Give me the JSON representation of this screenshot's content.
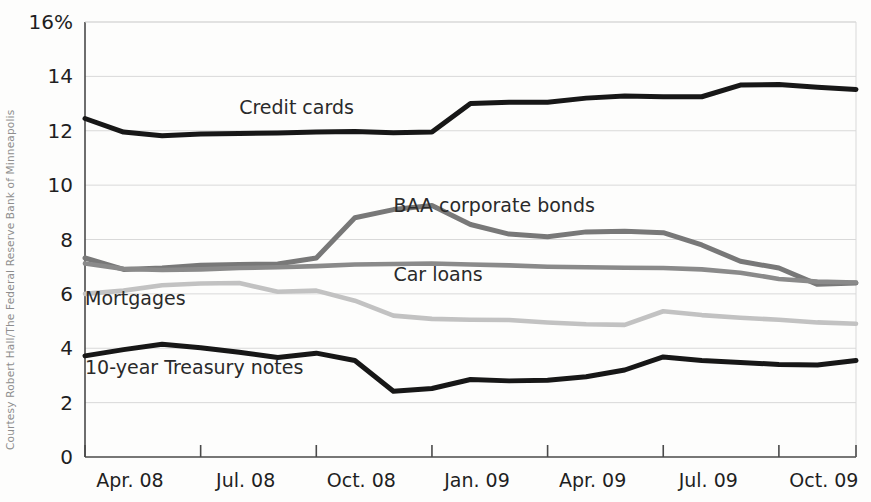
{
  "credit": {
    "text": "Courtesy Robert Hall/The Federal Reserve Bank of Minneapolis"
  },
  "chart_data": {
    "type": "line",
    "title": "",
    "subtitle": "",
    "xlabel": "",
    "ylabel": "",
    "grid": true,
    "legend_position": "inline-labels",
    "ylim": [
      0,
      16
    ],
    "yticks": [
      0,
      2,
      4,
      6,
      8,
      10,
      12,
      14,
      16
    ],
    "ytick_labels": [
      "0",
      "2",
      "4",
      "6",
      "8",
      "10",
      "12",
      "14",
      "16%"
    ],
    "xlim": [
      "2008-04",
      "2009-12"
    ],
    "xticks": [
      "2008-04",
      "2008-07",
      "2008-10",
      "2009-01",
      "2009-04",
      "2009-07",
      "2009-10"
    ],
    "xtick_labels": [
      "Apr. 08",
      "Jul. 08",
      "Oct. 08",
      "Jan. 09",
      "Apr. 09",
      "Jul. 09",
      "Oct. 09"
    ],
    "x": [
      "2008-04",
      "2008-05",
      "2008-06",
      "2008-07",
      "2008-08",
      "2008-09",
      "2008-10",
      "2008-11",
      "2008-12",
      "2009-01",
      "2009-02",
      "2009-03",
      "2009-04",
      "2009-05",
      "2009-06",
      "2009-07",
      "2009-08",
      "2009-09",
      "2009-10",
      "2009-11",
      "2009-12"
    ],
    "series": [
      {
        "name": "Credit cards",
        "color": "#171717",
        "width": 5.0,
        "label_x": "2008-08",
        "label_y": 12.62,
        "values": [
          12.45,
          11.95,
          11.82,
          11.88,
          11.9,
          11.92,
          11.95,
          11.97,
          11.93,
          11.95,
          13.0,
          13.05,
          13.05,
          13.2,
          13.28,
          13.25,
          13.25,
          13.68,
          13.7,
          13.6,
          13.52
        ]
      },
      {
        "name": "BAA corporate bonds",
        "color": "#787878",
        "width": 5.0,
        "label_x": "2008-12",
        "label_y": 9.0,
        "values": [
          7.32,
          6.9,
          6.95,
          7.05,
          7.08,
          7.1,
          7.32,
          8.8,
          9.1,
          9.25,
          8.55,
          8.2,
          8.1,
          8.28,
          8.3,
          8.25,
          7.8,
          7.2,
          6.95,
          6.35,
          6.4
        ]
      },
      {
        "name": "Car loans",
        "color": "#8a8a8a",
        "width": 4.6,
        "label_x": "2008-12",
        "label_y": 6.48,
        "values": [
          7.12,
          6.92,
          6.88,
          6.9,
          6.95,
          6.98,
          7.02,
          7.08,
          7.1,
          7.12,
          7.08,
          7.05,
          7.0,
          6.98,
          6.96,
          6.95,
          6.9,
          6.78,
          6.55,
          6.45,
          6.42
        ]
      },
      {
        "name": "Mortgages",
        "color": "#c2c2c2",
        "width": 4.6,
        "label_x": "2008-04",
        "label_y": 5.58,
        "values": [
          6.0,
          6.12,
          6.32,
          6.38,
          6.4,
          6.08,
          6.12,
          5.75,
          5.2,
          5.08,
          5.05,
          5.04,
          4.95,
          4.88,
          4.86,
          5.36,
          5.22,
          5.12,
          5.05,
          4.95,
          4.9
        ]
      },
      {
        "name": "10-year Treasury notes",
        "color": "#171717",
        "width": 5.0,
        "label_x": "2008-04",
        "label_y": 3.05,
        "values": [
          3.72,
          3.95,
          4.15,
          4.02,
          3.85,
          3.66,
          3.82,
          3.55,
          2.42,
          2.52,
          2.85,
          2.8,
          2.82,
          2.95,
          3.2,
          3.68,
          3.55,
          3.48,
          3.4,
          3.38,
          3.55
        ]
      }
    ]
  }
}
